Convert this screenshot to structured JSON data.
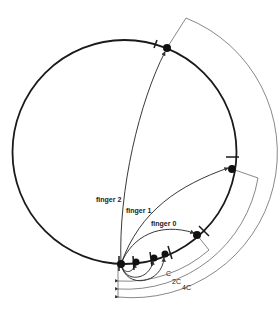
{
  "diagram": {
    "title": "",
    "ring": {
      "cx": 124.5,
      "cy": 152,
      "r": 112,
      "stroke": "#1a1a1a"
    },
    "nodes": [
      {
        "id": "base",
        "x": 121,
        "y": 264
      },
      {
        "id": "n1",
        "x": 136,
        "y": 262
      },
      {
        "id": "n2",
        "x": 154,
        "y": 258
      },
      {
        "id": "n3",
        "x": 165,
        "y": 254
      },
      {
        "id": "n4",
        "x": 197,
        "y": 235
      },
      {
        "id": "n5",
        "x": 232,
        "y": 169
      },
      {
        "id": "n6",
        "x": 167,
        "y": 48
      }
    ],
    "fingers": [
      {
        "label": "finger 0",
        "label_x": 151,
        "label_y": 224
      },
      {
        "label": "finger 1",
        "label_x": 126,
        "label_y": 211
      },
      {
        "label": "finger 2",
        "label_x": 96,
        "label_y": 200
      }
    ],
    "distances": [
      {
        "label": "C",
        "label_x": 166,
        "label_y": 273
      },
      {
        "label": "2C",
        "label_x": 173,
        "label_y": 281
      },
      {
        "label": "4C",
        "label_x": 182,
        "label_y": 287
      }
    ],
    "colors": {
      "ink": "#1a1a1a",
      "thin": "#555555",
      "background": "#ffffff"
    }
  }
}
